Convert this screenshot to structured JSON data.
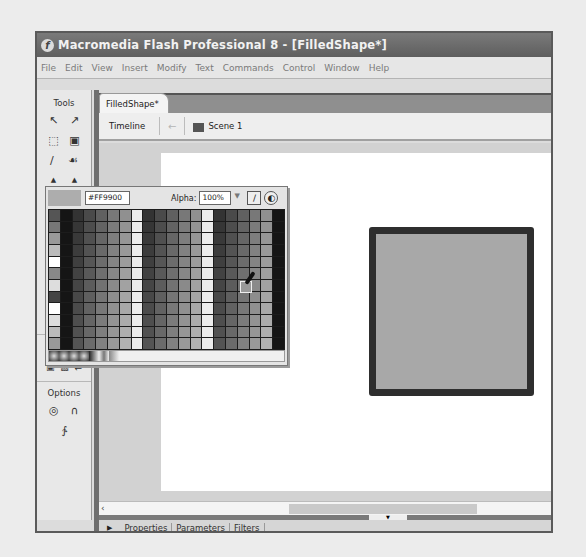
{
  "window": {
    "title": "Macromedia Flash Professional 8 - [FilledShape*]",
    "app_icon": "f"
  },
  "menu": [
    "File",
    "Edit",
    "View",
    "Insert",
    "Modify",
    "Text",
    "Commands",
    "Control",
    "Window",
    "Help"
  ],
  "tools": {
    "header": "Tools",
    "rows": [
      [
        "↖",
        "↗"
      ],
      [
        "⬚",
        "⚙"
      ],
      [
        "∕",
        "ₘ"
      ]
    ],
    "options_header": "Options"
  },
  "document": {
    "tab": "FilledShape*",
    "timeline_label": "Timeline",
    "scene_label": "Scene 1"
  },
  "swatches": {
    "hex_value": "#FF9900",
    "alpha_label": "Alpha:",
    "alpha_value": "100%",
    "colors": {
      "fill": "#adadad",
      "stroke": "#2e2e2e"
    }
  },
  "properties_tabs": [
    "Properties",
    "Parameters",
    "Filters"
  ],
  "stage": {
    "shape": "filled square",
    "fill_color": "#a8a8a8",
    "stroke_color": "#2e2e2e"
  }
}
